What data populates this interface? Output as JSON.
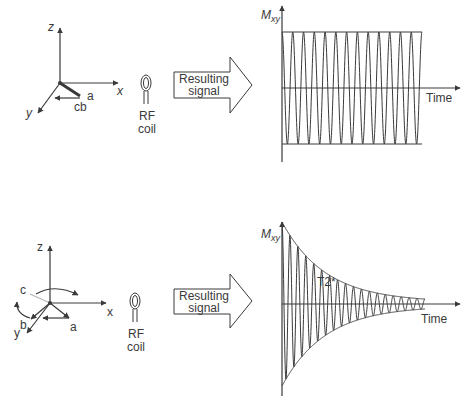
{
  "panels": [
    {
      "id": "top",
      "axes": {
        "z": "z",
        "x": "x",
        "y": "y"
      },
      "vectors": {
        "a": "a",
        "cb": "cb"
      },
      "coil": {
        "line1": "RF",
        "line2": "coil"
      },
      "arrow": {
        "line1": "Resulting",
        "line2": "signal"
      },
      "graph": {
        "ylabel": "M",
        "ylabel_sub": "xy",
        "xlabel": "Time",
        "signal": "constant-amplitude oscillation",
        "cycles": 13
      }
    },
    {
      "id": "bottom",
      "axes": {
        "z": "z",
        "x": "x",
        "y": "y"
      },
      "vectors": {
        "a": "a",
        "b": "b",
        "c": "c"
      },
      "coil": {
        "line1": "RF",
        "line2": "coil"
      },
      "arrow": {
        "line1": "Resulting",
        "line2": "signal"
      },
      "graph": {
        "ylabel": "M",
        "ylabel_sub": "xy",
        "xlabel": "Time",
        "annotation": "T2*",
        "signal": "exponentially decaying oscillation (free induction decay)",
        "cycles": 18
      }
    }
  ],
  "colors": {
    "line": "#3a3a3a",
    "faded": "#b5b5b5",
    "background": "#ffffff"
  }
}
